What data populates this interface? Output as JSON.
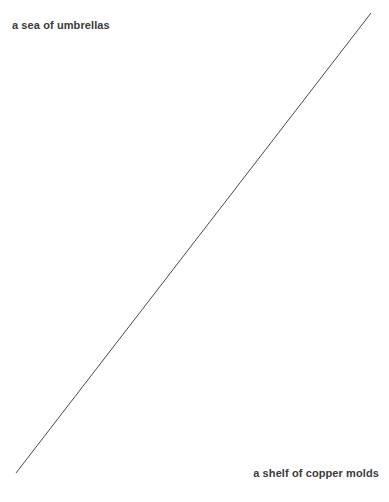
{
  "canvas": {
    "width": 389,
    "height": 502,
    "background_color": "#ffffff"
  },
  "labels": {
    "start": "a sea of umbrellas",
    "end": "a shelf of copper molds"
  },
  "connector": {
    "color": "#4a4a4a",
    "stroke_width": 1,
    "x1": 16,
    "y1": 473,
    "x2": 371,
    "y2": 13
  }
}
